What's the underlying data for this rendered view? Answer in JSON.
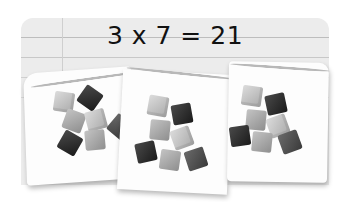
{
  "equation": {
    "text": "3 x 7 = 21",
    "factor_a": 3,
    "factor_b": 7,
    "product": 21
  },
  "groups": [
    {
      "label": "group-1",
      "cube_count": 7
    },
    {
      "label": "group-2",
      "cube_count": 7
    },
    {
      "label": "group-3",
      "cube_count": 7
    }
  ],
  "colors": {
    "panel": "#ececec",
    "ruled_line": "#bdbdbd",
    "card": "#fdfdfd",
    "cube_light": "#b8b8b8",
    "cube_dark": "#2a2a2a",
    "text": "#111111"
  }
}
